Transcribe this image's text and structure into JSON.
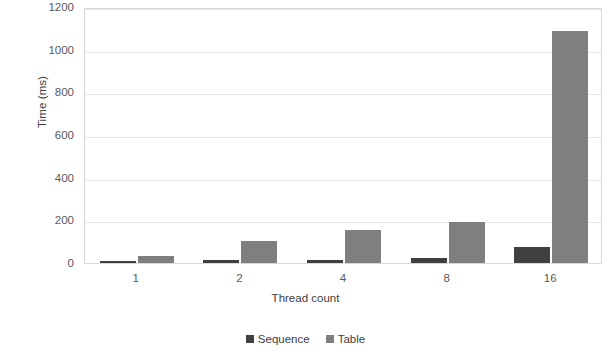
{
  "chart_data": {
    "type": "bar",
    "title": "",
    "xlabel": "Thread count",
    "ylabel": "Time (ms)",
    "categories": [
      "1",
      "2",
      "4",
      "8",
      "16"
    ],
    "series": [
      {
        "name": "Sequence",
        "color": "#404040",
        "values": [
          8,
          14,
          16,
          25,
          76
        ]
      },
      {
        "name": "Table",
        "color": "#7f7f7f",
        "values": [
          35,
          103,
          155,
          190,
          1087
        ]
      }
    ],
    "ylim": [
      0,
      1200
    ],
    "yticks": [
      0,
      200,
      400,
      600,
      800,
      1000,
      1200
    ],
    "ytick_labels": [
      "0",
      "200",
      "400",
      "600",
      "800",
      "1000",
      "1200"
    ],
    "grid": true,
    "legend_position": "bottom"
  }
}
